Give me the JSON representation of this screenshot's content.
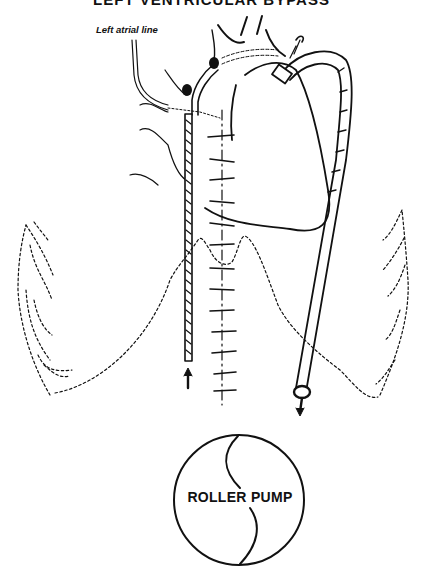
{
  "figure": {
    "title": "LEFT VENTRICULAR BYPASS",
    "title_visibility": "partially cropped at top edge"
  },
  "labels": {
    "left_atrial_line": "Left atrial line",
    "roller_pump": "ROLLER PUMP"
  },
  "elements": {
    "heart": "heart-outline",
    "inflow_cannula": "left-atrial-drainage-cannula",
    "outflow_graft": "aortic-return-graft",
    "sternal_closure": "sternal-wire-sutures",
    "rib_cage": "dashed-rib-cage-outline",
    "pump": "roller-pump-circle"
  },
  "arrows": {
    "inflow_direction": "up",
    "outflow_direction": "down"
  },
  "colors": {
    "ink": "#111111",
    "background": "#ffffff"
  }
}
